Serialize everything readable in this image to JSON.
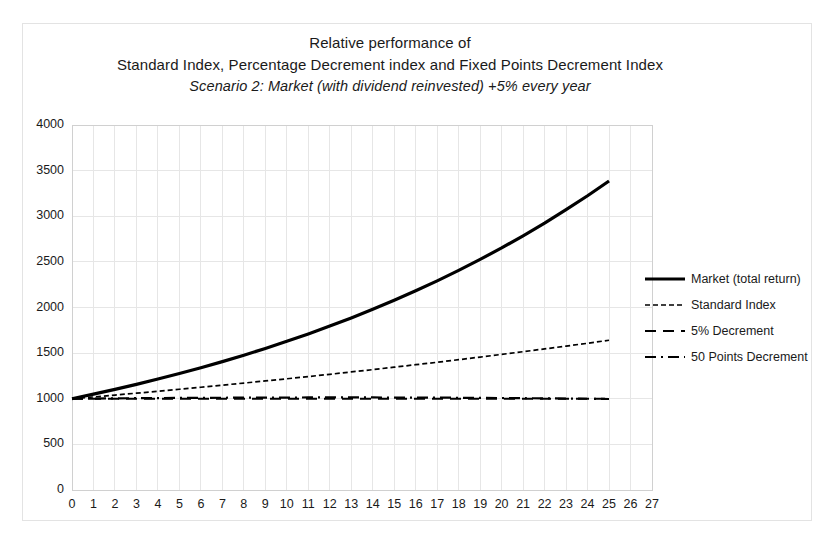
{
  "chart_data": {
    "type": "line",
    "title": "Relative performance of",
    "title_lines": [
      "Relative performance of",
      "Standard Index, Percentage Decrement index and Fixed Points Decrement Index",
      "Scenario 2: Market (with dividend reinvested) +5% every year"
    ],
    "subtitle": "Scenario 2: Market (with dividend reinvested) +5% every year",
    "xlabel": "",
    "ylabel": "",
    "xlim": [
      0,
      27
    ],
    "ylim": [
      0,
      4000
    ],
    "ytick_labels": [
      "4000",
      "3500",
      "3000",
      "2500",
      "2000",
      "1500",
      "1000",
      "500",
      "0"
    ],
    "yticks": [
      4000,
      3500,
      3000,
      2500,
      2000,
      1500,
      1000,
      500,
      0
    ],
    "xtick_labels": [
      "0",
      "1",
      "2",
      "3",
      "4",
      "5",
      "6",
      "7",
      "8",
      "9",
      "10",
      "11",
      "12",
      "13",
      "14",
      "15",
      "16",
      "17",
      "18",
      "19",
      "20",
      "21",
      "22",
      "23",
      "24",
      "25",
      "26",
      "27"
    ],
    "xticks": [
      0,
      1,
      2,
      3,
      4,
      5,
      6,
      7,
      8,
      9,
      10,
      11,
      12,
      13,
      14,
      15,
      16,
      17,
      18,
      19,
      20,
      21,
      22,
      23,
      24,
      25,
      26,
      27
    ],
    "grid": true,
    "legend_position": "right",
    "x": [
      0,
      1,
      2,
      3,
      4,
      5,
      6,
      7,
      8,
      9,
      10,
      11,
      12,
      13,
      14,
      15,
      16,
      17,
      18,
      19,
      20,
      21,
      22,
      23,
      24,
      25
    ],
    "series": [
      {
        "name": "Market (total return)",
        "style": "solid",
        "width": 3.2,
        "color": "#000000",
        "values": [
          1000,
          1050,
          1103,
          1158,
          1216,
          1276,
          1340,
          1407,
          1477,
          1551,
          1629,
          1710,
          1796,
          1886,
          1980,
          2079,
          2183,
          2292,
          2407,
          2527,
          2653,
          2786,
          2925,
          3072,
          3225,
          3386
        ]
      },
      {
        "name": "Standard Index",
        "style": "fine-dash",
        "width": 1.7,
        "color": "#000000",
        "values": [
          1000,
          1020,
          1040,
          1061,
          1082,
          1104,
          1126,
          1149,
          1172,
          1195,
          1219,
          1243,
          1268,
          1294,
          1319,
          1346,
          1373,
          1400,
          1428,
          1457,
          1486,
          1516,
          1546,
          1577,
          1608,
          1641
        ]
      },
      {
        "name": "5% Decrement",
        "style": "dashed",
        "width": 2.2,
        "color": "#000000",
        "values": [
          1000,
          1000,
          1000,
          1000,
          1000,
          1000,
          1000,
          1000,
          1000,
          1000,
          1000,
          1000,
          1000,
          1000,
          1000,
          1000,
          1000,
          1000,
          1000,
          1000,
          1000,
          1000,
          1000,
          1000,
          1000,
          1000
        ]
      },
      {
        "name": "50 Points Decrement",
        "style": "dash-dot",
        "width": 2.2,
        "color": "#000000",
        "values": [
          1000,
          1002,
          1004,
          1006,
          1007,
          1009,
          1010,
          1011,
          1012,
          1013,
          1013,
          1014,
          1014,
          1014,
          1014,
          1013,
          1013,
          1012,
          1011,
          1009,
          1008,
          1006,
          1004,
          1002,
          1000,
          997
        ]
      }
    ]
  },
  "legend": {
    "items": [
      {
        "label": "Market (total return)",
        "style": "solid"
      },
      {
        "label": "Standard Index",
        "style": "fine-dash"
      },
      {
        "label": "5% Decrement",
        "style": "dashed"
      },
      {
        "label": "50 Points Decrement",
        "style": "dash-dot"
      }
    ]
  },
  "colors": {
    "line": "#000000",
    "grid": "#e6e6e6",
    "axis": "#d0d0d0",
    "border": "#e3e3e3",
    "text": "#1a1a1a",
    "background": "#ffffff"
  }
}
